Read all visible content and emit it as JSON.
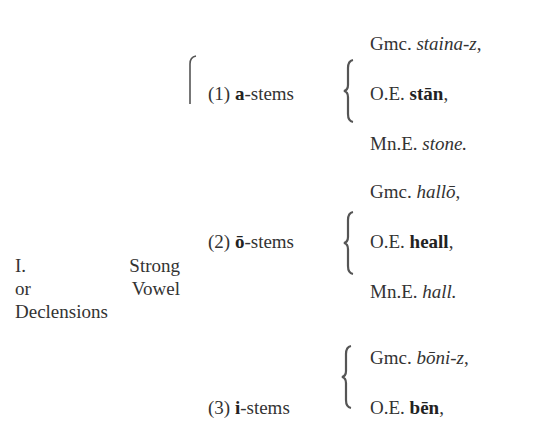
{
  "heading": {
    "line1_left": "I.",
    "line1_right": "Strong",
    "line2_left": "or",
    "line2_right": "Vowel",
    "line3": "Declensions"
  },
  "groups": [
    {
      "label_num": "(1)",
      "label_stem": "a",
      "label_suffix": "-stems",
      "rows": [
        {
          "prefix": "Gmc.",
          "form": "staina-z",
          "punct": ",",
          "style": "italic"
        },
        {
          "prefix": "O.E.",
          "form": "stān",
          "punct": ",",
          "style": "bold"
        },
        {
          "prefix": "Mn.E.",
          "form": "stone.",
          "punct": "",
          "style": "italic"
        }
      ]
    },
    {
      "label_num": "(2)",
      "label_stem": "ō",
      "label_suffix": "-stems",
      "rows": [
        {
          "prefix": "Gmc.",
          "form": "hallō",
          "punct": ",",
          "style": "italic"
        },
        {
          "prefix": "O.E.",
          "form": "heall",
          "punct": ",",
          "style": "bold"
        },
        {
          "prefix": "Mn.E.",
          "form": "hall.",
          "punct": "",
          "style": "italic"
        }
      ]
    },
    {
      "label_num": "(3)",
      "label_stem": "i",
      "label_suffix": "-stems",
      "rows": [
        {
          "prefix": "Gmc.",
          "form": "bōni-z",
          "punct": ",",
          "style": "italic"
        },
        {
          "prefix": "O.E.",
          "form": "bēn",
          "punct": ",",
          "style": "bold"
        }
      ]
    }
  ]
}
